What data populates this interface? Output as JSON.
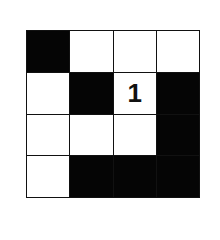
{
  "puzzle": {
    "rows": 4,
    "cols": 4,
    "cells": [
      [
        {
          "color": "black",
          "value": ""
        },
        {
          "color": "white",
          "value": ""
        },
        {
          "color": "white",
          "value": ""
        },
        {
          "color": "white",
          "value": ""
        }
      ],
      [
        {
          "color": "white",
          "value": ""
        },
        {
          "color": "black",
          "value": ""
        },
        {
          "color": "white",
          "value": "1"
        },
        {
          "color": "black",
          "value": ""
        }
      ],
      [
        {
          "color": "white",
          "value": ""
        },
        {
          "color": "white",
          "value": ""
        },
        {
          "color": "white",
          "value": ""
        },
        {
          "color": "black",
          "value": ""
        }
      ],
      [
        {
          "color": "white",
          "value": ""
        },
        {
          "color": "black",
          "value": ""
        },
        {
          "color": "black",
          "value": ""
        },
        {
          "color": "black",
          "value": ""
        }
      ]
    ]
  },
  "colors": {
    "black": "#050505",
    "white": "#ffffff",
    "line": "#111111"
  }
}
